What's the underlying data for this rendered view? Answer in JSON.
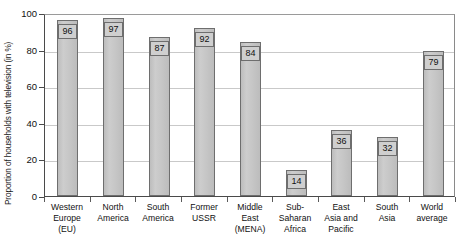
{
  "chart_data": {
    "type": "bar",
    "title": "",
    "xlabel": "",
    "ylabel": "Proportion of households with television (in %)",
    "ylim": [
      0,
      100
    ],
    "yticks": [
      0,
      20,
      40,
      60,
      80,
      100
    ],
    "grid": true,
    "legend": "none",
    "categories": [
      "Western\nEurope\n(EU)",
      "North\nAmerica",
      "South\nAmerica",
      "Former\nUSSR",
      "Middle\nEast\n(MENA)",
      "Sub-\nSaharan\nAfrica",
      "East\nAsia and\nPacific",
      "South\nAsia",
      "World\naverage"
    ],
    "values": [
      96,
      97,
      87,
      92,
      84,
      14,
      36,
      32,
      79
    ],
    "value_labels": [
      "96",
      "97",
      "87",
      "92",
      "84",
      "14",
      "36",
      "32",
      "79"
    ],
    "colors": {
      "bar_fill": "#c5c5c5",
      "bar_border": "#6e6e6e",
      "gridline": "#c9c9c9",
      "axis": "#4a4a4a",
      "text": "#111111",
      "background": "#ffffff"
    }
  },
  "axis": {
    "y_tick_labels": [
      "0",
      "20",
      "40",
      "60",
      "80",
      "100"
    ]
  }
}
